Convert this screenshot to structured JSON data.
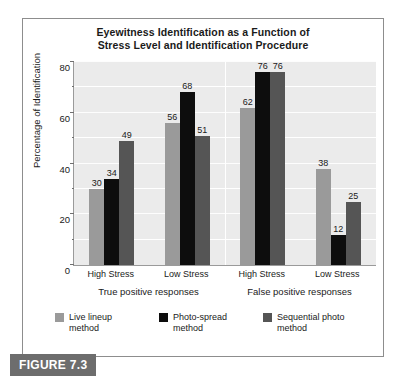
{
  "figure": {
    "caption_label": "FIGURE 7.3"
  },
  "chart_data": {
    "type": "bar",
    "title": "Eyewitness Identification as a Function of Stress Level and Identification Procedure",
    "title_line1": "Eyewitness Identification as a Function of",
    "title_line2": "Stress Level and Identification Procedure",
    "xlabel": "",
    "ylabel": "Percentage of Identification",
    "ylim": [
      0,
      80
    ],
    "ytick_labels": [
      "0",
      "20",
      "40",
      "60",
      "80"
    ],
    "ytick_values": [
      0,
      20,
      40,
      60,
      80
    ],
    "minor_gridline_values": [
      10,
      30,
      50,
      70
    ],
    "grid": true,
    "legend_position": "bottom-left",
    "categories": [
      "High Stress",
      "Low Stress",
      "High Stress",
      "Low Stress"
    ],
    "group_labels": [
      "True positive responses",
      "False positive responses"
    ],
    "series": [
      {
        "name": "Live lineup method",
        "color": "#9a9a9a",
        "values": [
          30,
          56,
          62,
          38
        ]
      },
      {
        "name": "Photo-spread method",
        "color": "#0d0d0d",
        "values": [
          34,
          68,
          76,
          12
        ]
      },
      {
        "name": "Sequential photo method",
        "color": "#555555",
        "values": [
          49,
          51,
          76,
          25
        ]
      }
    ]
  }
}
